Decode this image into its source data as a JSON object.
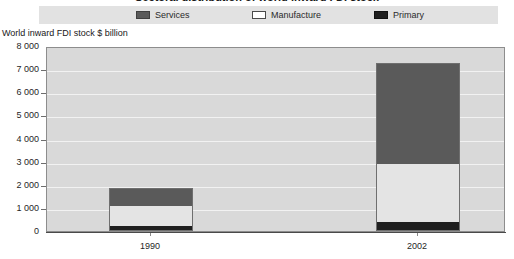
{
  "chart_data": {
    "type": "bar",
    "subtype": "stacked-column",
    "title": "Sectoral distribution of world inward FDI stock",
    "axis_caption": "World inward FDI stock $ billion",
    "categories": [
      "1990",
      "2002"
    ],
    "series": [
      {
        "name": "Primary",
        "values": [
          180,
          350
        ],
        "color": "#1f1f1f"
      },
      {
        "name": "Manufacture",
        "values": [
          900,
          2550
        ],
        "color": "#e4e4e4"
      },
      {
        "name": "Services",
        "values": [
          780,
          4360
        ],
        "color": "#5a5a5a"
      }
    ],
    "cumulative_tops": {
      "1990": {
        "primary": 180,
        "manufacture": 1080,
        "services": 1860
      },
      "2002": {
        "primary": 350,
        "manufacture": 2900,
        "services": 7260
      }
    },
    "totals": [
      1860,
      7260
    ],
    "xlabel": "",
    "ylabel": "World inward FDI stock $ billion",
    "ylim": [
      0,
      8000
    ],
    "ytick_step": 1000,
    "ytick_labels": [
      "8 000",
      "7 000",
      "6 000",
      "5 000",
      "4 000",
      "3 000",
      "2 000",
      "1 000",
      "0"
    ],
    "ytick_values": [
      8000,
      7000,
      6000,
      5000,
      4000,
      3000,
      2000,
      1000,
      0
    ],
    "grid": true,
    "legend_position": "top",
    "legend_entries": [
      "Services",
      "Manufacture",
      "Primary"
    ],
    "plot_background": "#d9d9d9",
    "legend_background": "#e2e2e2"
  },
  "legend": {
    "services_label": "Services",
    "manufacture_label": "Manufacture",
    "primary_label": "Primary"
  },
  "axes": {
    "caption": "World inward FDI stock $ billion",
    "y_labels": [
      "8 000",
      "7 000",
      "6 000",
      "5 000",
      "4 000",
      "3 000",
      "2 000",
      "1 000",
      "0"
    ],
    "x_labels": [
      "1990",
      "2002"
    ]
  },
  "title": "Sectoral distribution of world inward FDI stock"
}
